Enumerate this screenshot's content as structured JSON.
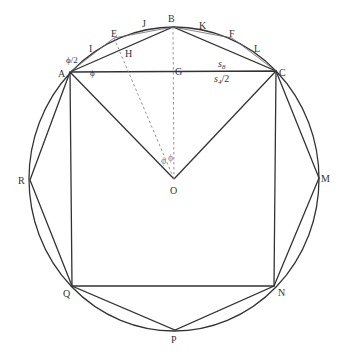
{
  "diagram": {
    "points": {
      "A": "A",
      "B": "B",
      "C": "C",
      "E": "E",
      "F": "F",
      "G": "G",
      "H": "H",
      "I1": "I",
      "J": "J",
      "K": "K",
      "L": "L",
      "M": "M",
      "N": "N",
      "O": "O",
      "P": "P",
      "Q": "Q",
      "R": "R"
    },
    "annotations": {
      "phi_half": "ϕ/2",
      "phi_at_A": "ϕ",
      "phi_at_O_left": "ϕ",
      "phi_at_O_right": "ϕ",
      "s8": "s",
      "s8_sub": "8",
      "s4_half": "s",
      "s4_sub": "4",
      "s4_half_suffix": "/2"
    }
  }
}
